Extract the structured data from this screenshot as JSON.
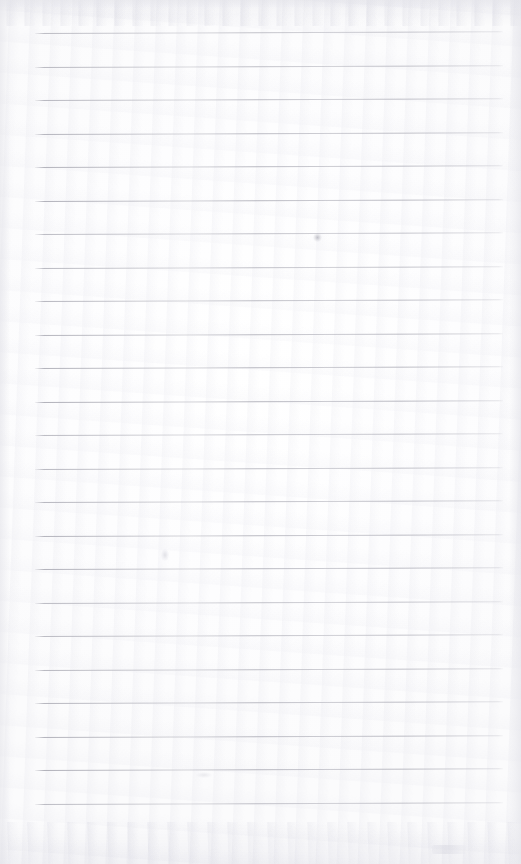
{
  "document": {
    "kind": "scanned-lined-notebook-page",
    "title": "Blank Ruled Notebook Page",
    "width": 521,
    "height": 864,
    "has_visible_text": false,
    "visible_text": ""
  },
  "paper": {
    "background_color": "#fdfdfd",
    "tone_color": "#fbfbfc",
    "noise_color": "#e8e8ee"
  },
  "rules": {
    "count": 24,
    "color": "#aeaeb8",
    "thickness_px": 1,
    "left_x": 35,
    "right_x": 503,
    "first_y": 33,
    "spacing_px": 33.5,
    "slant_deg": -0.22,
    "positions": [
      33,
      66.5,
      100,
      133.5,
      167,
      200.5,
      234,
      267.5,
      301,
      334.5,
      368,
      401.5,
      435,
      468.5,
      502,
      535.5,
      569,
      602.5,
      636,
      669.5,
      703,
      736.5,
      770,
      803.5
    ]
  },
  "marks": [
    {
      "name": "smudge-on-line-upper",
      "x": 313,
      "y": 233,
      "variant": "a"
    },
    {
      "name": "smudge-above-line-middle",
      "x": 161,
      "y": 549,
      "variant": "b"
    },
    {
      "name": "smudge-faint-lower",
      "x": 196,
      "y": 772,
      "variant": "c"
    },
    {
      "name": "smudge-bottom-right-edge",
      "x": 432,
      "y": 845,
      "variant": "d"
    }
  ],
  "edges": {
    "left_shadow": true,
    "right_shadow": true,
    "top_shadow": true,
    "bottom_band": true
  }
}
